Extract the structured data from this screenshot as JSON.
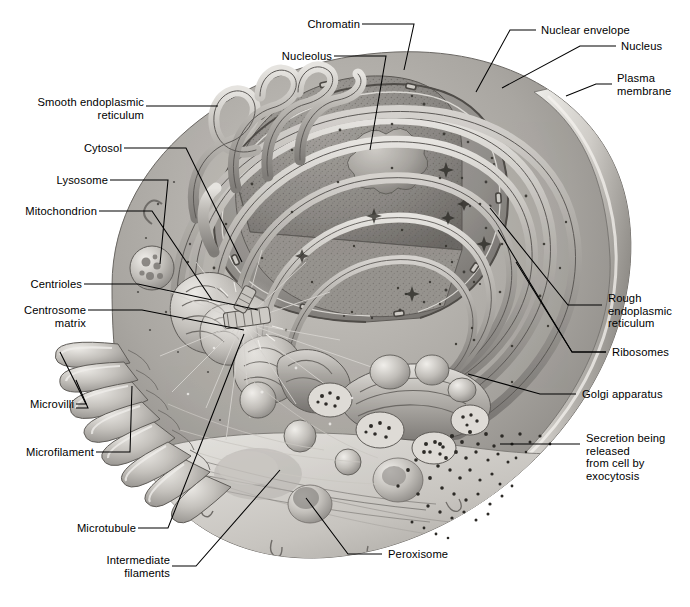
{
  "figure": {
    "type": "biological-diagram",
    "palette": {
      "background": "#ffffff",
      "ink": "#000000",
      "cytoplasm_light": "#d8d6d2",
      "cytoplasm_mid": "#a8a5a0",
      "cytoplasm_dark": "#6e6b67",
      "membrane_highlight": "#f2f0ec",
      "nucleus_fill": "#8f8c88",
      "nucleolus": "#b9b6b1",
      "ribosome_dot": "#3a3834"
    }
  },
  "labels": {
    "left": [
      {
        "id": "smooth-er",
        "text": "Smooth endoplasmic\nreticulum"
      },
      {
        "id": "cytosol",
        "text": "Cytosol"
      },
      {
        "id": "lysosome",
        "text": "Lysosome"
      },
      {
        "id": "mitochondrion",
        "text": "Mitochondrion"
      },
      {
        "id": "centrioles",
        "text": "Centrioles"
      },
      {
        "id": "centrosome-matrix",
        "text": "Centrosome\nmatrix"
      },
      {
        "id": "microvilli",
        "text": "Microvilli"
      },
      {
        "id": "microfilament",
        "text": "Microfilament"
      },
      {
        "id": "microtubule",
        "text": "Microtubule"
      },
      {
        "id": "intermediate-filaments",
        "text": "Intermediate\nfilaments"
      }
    ],
    "top": [
      {
        "id": "chromatin",
        "text": "Chromatin"
      },
      {
        "id": "nucleolus",
        "text": "Nucleolus"
      }
    ],
    "right": [
      {
        "id": "nuclear-envelope",
        "text": "Nuclear envelope"
      },
      {
        "id": "nucleus",
        "text": "Nucleus"
      },
      {
        "id": "plasma-membrane",
        "text": "Plasma\nmembrane"
      },
      {
        "id": "rough-er",
        "text": "Rough\nendoplasmic\nreticulum"
      },
      {
        "id": "ribosomes",
        "text": "Ribosomes"
      },
      {
        "id": "golgi-apparatus",
        "text": "Golgi apparatus"
      },
      {
        "id": "secretion",
        "text": "Secretion being released\nfrom cell by exocytosis"
      }
    ],
    "bottom": [
      {
        "id": "peroxisome",
        "text": "Peroxisome"
      }
    ]
  }
}
